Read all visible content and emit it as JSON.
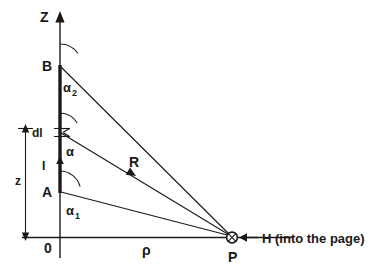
{
  "figure": {
    "title_alt": "Magnetic field of a finite straight current-carrying wire",
    "axes": {
      "vertical_label": "Z",
      "horizontal_label": "ρ",
      "origin_label": "0"
    },
    "points": {
      "top_endpoint": "B",
      "bottom_endpoint": "A",
      "field_point": "P"
    },
    "angles": {
      "upper": "α",
      "upper_sub": "2",
      "middle": "α",
      "lower": "α",
      "lower_sub": "1"
    },
    "labels": {
      "current": "I",
      "element": "dl",
      "height": "z",
      "distance_vector": "R",
      "field": "H (into the page)"
    },
    "icons": {
      "into_page": "circled-cross-icon",
      "z_axis_arrow": "arrow-up-icon",
      "current_arrow": "arrow-up-icon",
      "r_arrow": "arrow-right-icon",
      "h_arrow": "arrow-left-icon"
    },
    "colors": {
      "ink": "#1a1a1a",
      "background": "#ffffff"
    }
  }
}
